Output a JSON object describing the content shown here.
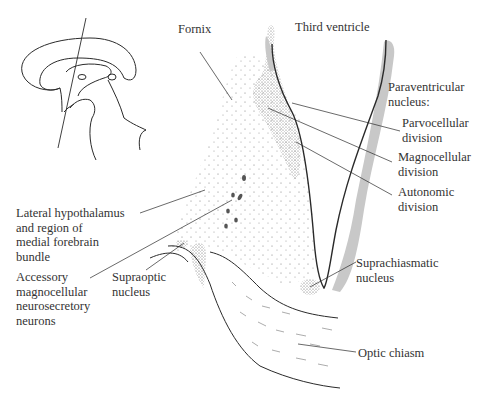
{
  "diagram": {
    "type": "anatomical-illustration",
    "labels": {
      "fornix": "Fornix",
      "third_ventricle": "Third ventricle",
      "paraventricular": "Paraventricular\nnucleus:",
      "parvocellular": "Parvocellular\ndivision",
      "magnocellular": "Magnocellular\ndivision",
      "autonomic": "Autonomic\ndivision",
      "lateral_hypothalamus": "Lateral hypothalamus\nand region of\nmedial forebrain\nbundle",
      "accessory": "Accessory\nmagnocellular\nneurosecretory\nneurons",
      "supraoptic": "Supraoptic\nnucleus",
      "suprachiasmatic": "Suprachiasmatic\nnucleus",
      "optic_chiasm": "Optic chiasm"
    },
    "colors": {
      "line": "#2a2a2a",
      "ventricle_shade": "#c8c8c8",
      "stipple": "#555555"
    }
  }
}
